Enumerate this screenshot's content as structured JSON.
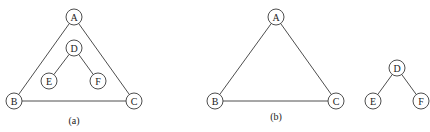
{
  "diagrams": [
    {
      "id": "a",
      "caption": "(a)",
      "caption_pos": [
        74,
        124
      ],
      "nodes": [
        {
          "id": "A",
          "label": "A",
          "x": 74,
          "y": 17
        },
        {
          "id": "D",
          "label": "D",
          "x": 74,
          "y": 48
        },
        {
          "id": "E",
          "label": "E",
          "x": 49,
          "y": 81
        },
        {
          "id": "F",
          "label": "F",
          "x": 98,
          "y": 81
        },
        {
          "id": "B",
          "label": "B",
          "x": 14,
          "y": 101
        },
        {
          "id": "C",
          "label": "C",
          "x": 134,
          "y": 101
        }
      ],
      "edges": [
        [
          "A",
          "B"
        ],
        [
          "A",
          "C"
        ],
        [
          "B",
          "C"
        ],
        [
          "D",
          "E"
        ],
        [
          "D",
          "F"
        ]
      ]
    },
    {
      "id": "b",
      "caption": "(b)",
      "caption_pos": [
        276,
        120
      ],
      "nodes": [
        {
          "id": "A",
          "label": "A",
          "x": 276,
          "y": 17
        },
        {
          "id": "B",
          "label": "B",
          "x": 215,
          "y": 101
        },
        {
          "id": "C",
          "label": "C",
          "x": 336,
          "y": 101
        },
        {
          "id": "D",
          "label": "D",
          "x": 397,
          "y": 68
        },
        {
          "id": "E",
          "label": "E",
          "x": 373,
          "y": 101
        },
        {
          "id": "F",
          "label": "F",
          "x": 421,
          "y": 101
        }
      ],
      "edges": [
        [
          "A",
          "B"
        ],
        [
          "A",
          "C"
        ],
        [
          "B",
          "C"
        ],
        [
          "D",
          "E"
        ],
        [
          "D",
          "F"
        ]
      ]
    }
  ],
  "node_radius": 8,
  "stroke_color": "#3a3a3a"
}
